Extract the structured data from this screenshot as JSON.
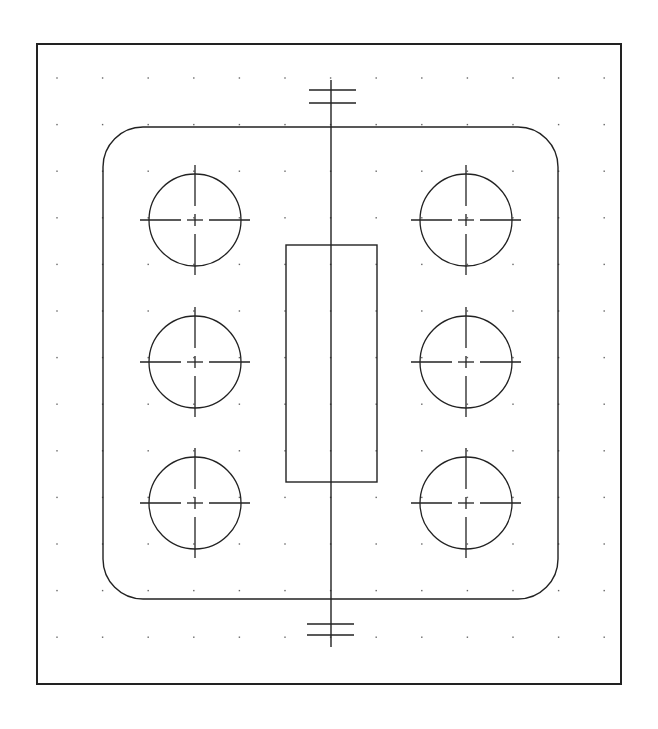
{
  "drawing": {
    "stroke_color": "#222222",
    "grid_dot_color": "#666666",
    "border": {
      "x": 37,
      "y": 44,
      "w": 584,
      "h": 640
    },
    "grid": {
      "x0": 57,
      "y0": 78,
      "dx": 45.6,
      "dy": 46.6,
      "cols": 13,
      "rows": 13
    },
    "plate": {
      "x": 103,
      "y": 127,
      "w": 455,
      "h": 472,
      "r": 40
    },
    "center_rect": {
      "x": 286,
      "y": 245,
      "w": 91,
      "h": 237
    },
    "axis": {
      "x": 331,
      "y1": 80,
      "y2": 647
    },
    "top_ticks": [
      {
        "y": 90,
        "x1": 309,
        "x2": 356
      },
      {
        "y": 103,
        "x1": 309,
        "x2": 356
      }
    ],
    "bottom_ticks": [
      {
        "y": 624,
        "x1": 307,
        "x2": 354
      },
      {
        "y": 635,
        "x1": 307,
        "x2": 354
      }
    ],
    "holes": [
      {
        "cx": 195,
        "cy": 220,
        "r": 46
      },
      {
        "cx": 195,
        "cy": 362,
        "r": 46
      },
      {
        "cx": 195,
        "cy": 503,
        "r": 46
      },
      {
        "cx": 466,
        "cy": 220,
        "r": 46
      },
      {
        "cx": 466,
        "cy": 362,
        "r": 46
      },
      {
        "cx": 466,
        "cy": 503,
        "r": 46
      }
    ]
  }
}
